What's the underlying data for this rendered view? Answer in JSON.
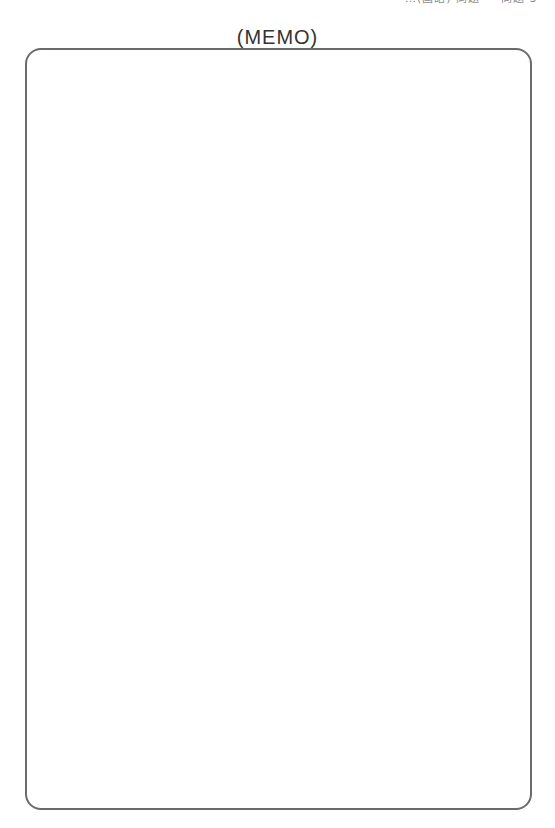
{
  "page": {
    "header_clipped_text": "…(国語) 問題 — 問題 3 -",
    "title": "(MEMO)"
  },
  "memo_area": {
    "content": ""
  },
  "colors": {
    "border": "#6b6b6b",
    "title_text": "#333333",
    "background": "#ffffff"
  }
}
